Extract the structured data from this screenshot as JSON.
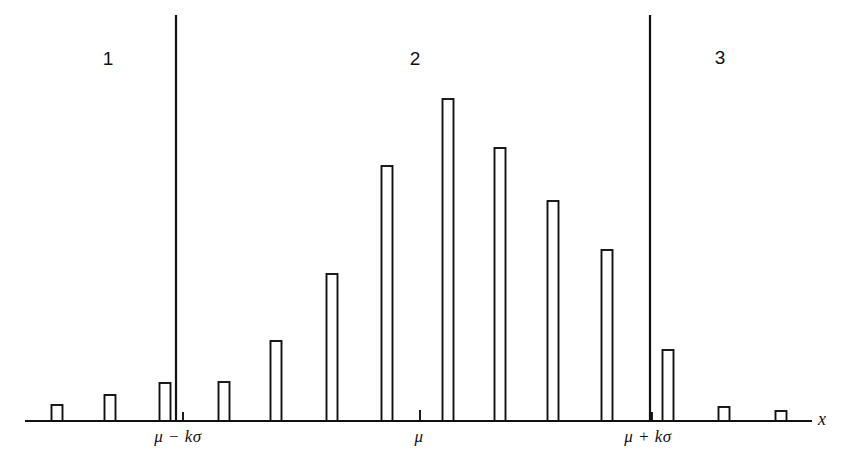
{
  "figure": {
    "background_color": "#ffffff",
    "ink_color": "#111111"
  },
  "region_labels": [
    {
      "text": "1",
      "x": 108,
      "y": 58
    },
    {
      "text": "2",
      "x": 415,
      "y": 58
    },
    {
      "text": "3",
      "x": 720,
      "y": 57
    }
  ],
  "axis_tick_labels": [
    {
      "text": "μ − kσ",
      "x": 178,
      "y": 428
    },
    {
      "text": "μ",
      "x": 419,
      "y": 428
    },
    {
      "text": "μ + kσ",
      "x": 648,
      "y": 428
    }
  ],
  "axis_name": {
    "text": "x",
    "x": 818,
    "y": 419
  },
  "chart_data": {
    "type": "bar",
    "title": "",
    "subtitle": "",
    "xlabel": "x",
    "ylabel": "",
    "grid": false,
    "legend": null,
    "axis": {
      "baseline_y": 421,
      "x_start": 25,
      "x_end": 810,
      "y_top": 15,
      "ylim": [
        0,
        1.0
      ]
    },
    "bar_width_px": 11,
    "categories": [
      "x1",
      "x2",
      "x3",
      "x4",
      "x5",
      "x6",
      "x7",
      "x8",
      "x9",
      "x10",
      "x11",
      "x12",
      "x13",
      "x14",
      "x15"
    ],
    "bars": [
      {
        "cx": 57,
        "top_y": 405,
        "height_px": 16,
        "value": 0.04
      },
      {
        "cx": 110,
        "top_y": 395,
        "height_px": 26,
        "value": 0.06
      },
      {
        "cx": 165,
        "top_y": 383,
        "height_px": 38,
        "value": 0.09
      },
      {
        "cx": 224,
        "top_y": 382,
        "height_px": 39,
        "value": 0.1
      },
      {
        "cx": 276,
        "top_y": 341,
        "height_px": 80,
        "value": 0.2
      },
      {
        "cx": 332,
        "top_y": 274,
        "height_px": 147,
        "value": 0.36
      },
      {
        "cx": 387,
        "top_y": 166,
        "height_px": 255,
        "value": 0.63
      },
      {
        "cx": 448,
        "top_y": 99,
        "height_px": 322,
        "value": 0.79
      },
      {
        "cx": 500,
        "top_y": 148,
        "height_px": 273,
        "value": 0.67
      },
      {
        "cx": 553,
        "top_y": 201,
        "height_px": 220,
        "value": 0.54
      },
      {
        "cx": 607,
        "top_y": 250,
        "height_px": 171,
        "value": 0.42
      },
      {
        "cx": 668,
        "top_y": 350,
        "height_px": 71,
        "value": 0.17
      },
      {
        "cx": 724,
        "top_y": 407,
        "height_px": 14,
        "value": 0.03
      },
      {
        "cx": 781,
        "top_y": 411,
        "height_px": 10,
        "value": 0.02
      }
    ],
    "ticks": [
      {
        "x": 183,
        "length_px": 9
      },
      {
        "x": 420,
        "length_px": 11
      },
      {
        "x": 652,
        "length_px": 9
      }
    ],
    "dividers": [
      {
        "x": 176,
        "y_top": 15,
        "y_bottom": 421,
        "label": "μ − kσ boundary"
      },
      {
        "x": 650,
        "y_top": 15,
        "y_bottom": 421,
        "label": "μ + kσ boundary"
      }
    ],
    "regions": [
      {
        "name": "1",
        "from_x": 25,
        "to_x": 176
      },
      {
        "name": "2",
        "from_x": 176,
        "to_x": 650
      },
      {
        "name": "3",
        "from_x": 650,
        "to_x": 810
      }
    ]
  }
}
